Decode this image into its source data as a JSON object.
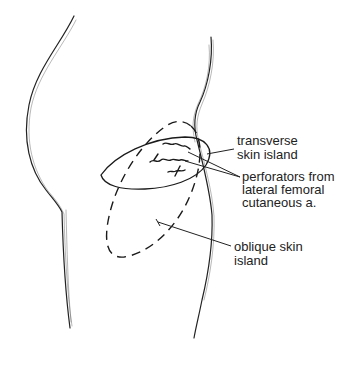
{
  "figure": {
    "colors": {
      "line": "#222222",
      "background": "#ffffff"
    }
  },
  "labels": {
    "transverse_island": {
      "line1": "transverse",
      "line2": "skin island"
    },
    "perforators": {
      "line1": "perforators from",
      "line2": "lateral femoral",
      "line3": "cutaneous a."
    },
    "oblique_island": {
      "line1": "oblique skin",
      "line2": "island"
    }
  }
}
